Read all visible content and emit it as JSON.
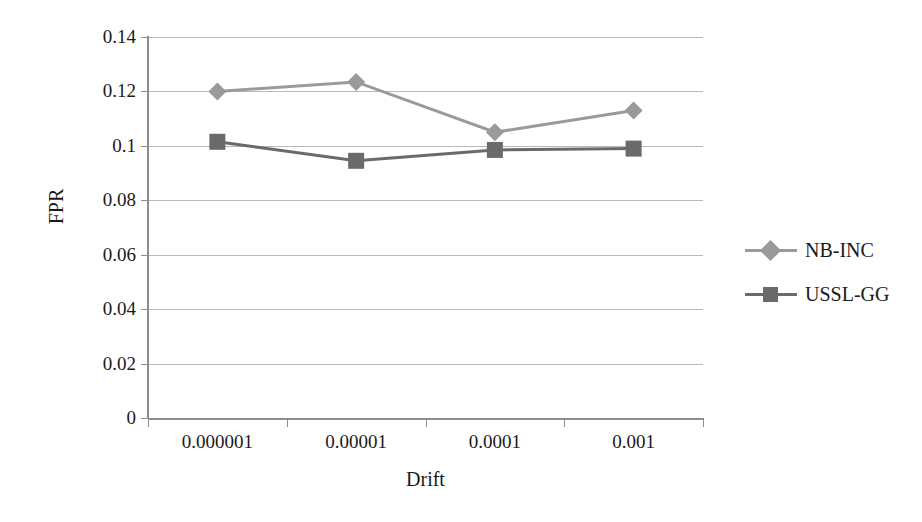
{
  "chart_data": {
    "type": "line",
    "title": "",
    "xlabel": "Drift",
    "ylabel": "FPR",
    "categories": [
      "0.000001",
      "0.00001",
      "0.0001",
      "0.001"
    ],
    "yticks": [
      "0.14",
      "0.12",
      "0.1",
      "0.08",
      "0.06",
      "0.04",
      "0.02",
      "0"
    ],
    "ytick_values": [
      0.14,
      0.12,
      0.1,
      0.08,
      0.06,
      0.04,
      0.02,
      0
    ],
    "ylim": [
      0,
      0.14
    ],
    "grid": "horizontal",
    "legend_position": "right",
    "series": [
      {
        "name": "NB-INC",
        "marker": "diamond",
        "color": "#9a9a9a",
        "values": [
          0.12,
          0.1235,
          0.105,
          0.113
        ]
      },
      {
        "name": "USSL-GG",
        "marker": "square",
        "color": "#6a6a6a",
        "values": [
          0.1015,
          0.0945,
          0.0985,
          0.099
        ]
      }
    ]
  },
  "legend": {
    "items": [
      {
        "label": "NB-INC"
      },
      {
        "label": "USSL-GG"
      }
    ]
  },
  "colors": {
    "series_nb_inc": "#9a9a9a",
    "series_ussl_gg": "#6a6a6a",
    "gridline": "#b9b9b9",
    "axis": "#8c8c8c",
    "text": "#1a1a1a",
    "background": "#ffffff"
  }
}
